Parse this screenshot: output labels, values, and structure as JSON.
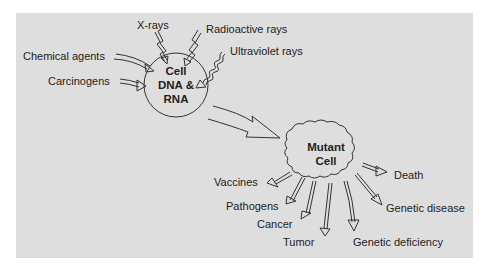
{
  "diagram": {
    "background_color": "#dedede",
    "stroke_color": "#333333",
    "cell": {
      "line1": "Cell",
      "line2": "DNA &",
      "line3": "RNA"
    },
    "mutant_cell": {
      "line1": "Mutant",
      "line2": "Cell"
    },
    "causes": [
      {
        "id": "x-rays",
        "label": "X-rays"
      },
      {
        "id": "radioactive-rays",
        "label": "Radioactive rays"
      },
      {
        "id": "ultraviolet-rays",
        "label": "Ultraviolet rays"
      },
      {
        "id": "chemical-agents",
        "label": "Chemical agents"
      },
      {
        "id": "carcinogens",
        "label": "Carcinogens"
      }
    ],
    "outcomes": [
      {
        "id": "vaccines",
        "label": "Vaccines"
      },
      {
        "id": "pathogens",
        "label": "Pathogens"
      },
      {
        "id": "cancer",
        "label": "Cancer"
      },
      {
        "id": "tumor",
        "label": "Tumor"
      },
      {
        "id": "genetic-deficiency",
        "label": "Genetic deficiency"
      },
      {
        "id": "genetic-disease",
        "label": "Genetic disease"
      },
      {
        "id": "death",
        "label": "Death"
      }
    ]
  }
}
